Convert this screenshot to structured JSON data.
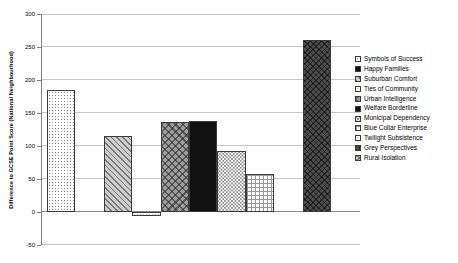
{
  "chart_data": {
    "type": "bar",
    "title": "",
    "xlabel": "",
    "ylabel": "Difference to GCSE Point Score (National Neighbourhood)",
    "ylim": [
      -50,
      300
    ],
    "yticks": [
      300,
      250,
      200,
      150,
      100,
      50,
      0,
      -50
    ],
    "grid": true,
    "legend_position": "right",
    "categories": [
      ""
    ],
    "series": [
      {
        "name": "Symbols of Success",
        "value": 185,
        "pattern": "dots-fine"
      },
      {
        "name": "Happy Families",
        "value": 0,
        "pattern": "solid-black"
      },
      {
        "name": "Suburban Comfort",
        "value": 115,
        "pattern": "diag-stripes"
      },
      {
        "name": "Ties of Community",
        "value": -6,
        "pattern": "dots-pale"
      },
      {
        "name": "Urban Intelligence",
        "value": 137,
        "pattern": "diag-cross-med"
      },
      {
        "name": "Welfare Borderline",
        "value": 138,
        "pattern": "solid-black"
      },
      {
        "name": "Municipal Dependency",
        "value": 92,
        "pattern": "checker-dots"
      },
      {
        "name": "Blue Collar Enterprise",
        "value": 57,
        "pattern": "grid-lines"
      },
      {
        "name": "Twilight Subsistence",
        "value": 0,
        "pattern": "dots-pale"
      },
      {
        "name": "Grey Perspectives",
        "value": 260,
        "pattern": "cross-dark"
      },
      {
        "name": "Rural Isolation",
        "value": 0,
        "pattern": "diag-cross-light"
      }
    ],
    "colors": {
      "background": "#ffffff",
      "gridline": "#c6c6c6",
      "axis": "#808080",
      "text": "#000000"
    }
  }
}
